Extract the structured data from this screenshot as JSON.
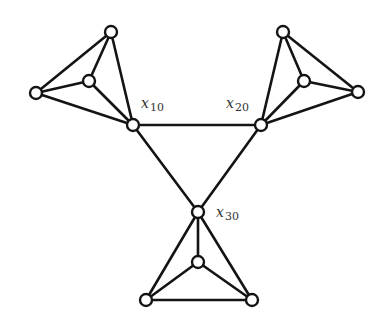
{
  "diagram": {
    "type": "graph",
    "colors": {
      "edge": "#141414",
      "node_fill": "#ffffff",
      "label": "#333333"
    },
    "nodes": [
      {
        "id": "x10",
        "x": 133,
        "y": 125,
        "label": "x",
        "sub": "10",
        "lx": 141,
        "ly": 108
      },
      {
        "id": "x20",
        "x": 261,
        "y": 125,
        "label": "x",
        "sub": "20",
        "lx": 226,
        "ly": 108
      },
      {
        "id": "x30",
        "x": 198,
        "y": 212,
        "label": "x",
        "sub": "30",
        "lx": 216,
        "ly": 217
      },
      {
        "id": "a_top",
        "x": 111,
        "y": 32
      },
      {
        "id": "a_in",
        "x": 89,
        "y": 81
      },
      {
        "id": "a_left",
        "x": 36,
        "y": 93
      },
      {
        "id": "b_top",
        "x": 283,
        "y": 32
      },
      {
        "id": "b_in",
        "x": 304,
        "y": 81
      },
      {
        "id": "b_right",
        "x": 358,
        "y": 92
      },
      {
        "id": "c_in",
        "x": 198,
        "y": 262
      },
      {
        "id": "c_left",
        "x": 146,
        "y": 300
      },
      {
        "id": "c_right",
        "x": 252,
        "y": 300
      }
    ],
    "edges": [
      [
        "x10",
        "x20"
      ],
      [
        "x10",
        "x30"
      ],
      [
        "x20",
        "x30"
      ],
      [
        "x10",
        "a_top"
      ],
      [
        "x10",
        "a_in"
      ],
      [
        "x10",
        "a_left"
      ],
      [
        "a_top",
        "a_in"
      ],
      [
        "a_top",
        "a_left"
      ],
      [
        "a_in",
        "a_left"
      ],
      [
        "x20",
        "b_top"
      ],
      [
        "x20",
        "b_in"
      ],
      [
        "x20",
        "b_right"
      ],
      [
        "b_top",
        "b_in"
      ],
      [
        "b_top",
        "b_right"
      ],
      [
        "b_in",
        "b_right"
      ],
      [
        "x30",
        "c_in"
      ],
      [
        "x30",
        "c_left"
      ],
      [
        "x30",
        "c_right"
      ],
      [
        "c_in",
        "c_left"
      ],
      [
        "c_in",
        "c_right"
      ],
      [
        "c_left",
        "c_right"
      ]
    ],
    "node_radius": 6
  }
}
